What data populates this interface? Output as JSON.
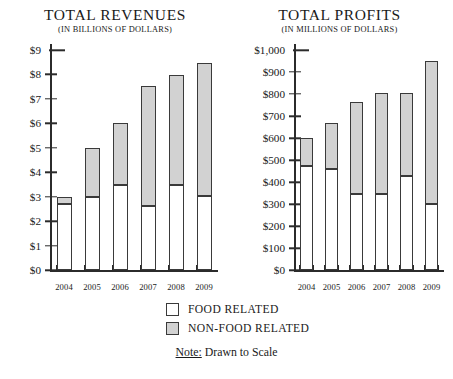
{
  "legend": {
    "items": [
      {
        "label": "FOOD RELATED",
        "key": "food",
        "color": "#ffffff"
      },
      {
        "label": "NON-FOOD RELATED",
        "key": "nonfood",
        "color": "#d2d2d2"
      }
    ],
    "note_key": "Note:",
    "note_text": "Drawn to Scale"
  },
  "chart_data": [
    {
      "type": "bar",
      "id": "total-revenues",
      "title": "TOTAL REVENUES",
      "subtitle": "(IN BILLIONS OF DOLLARS)",
      "stacked": true,
      "xlabel": "",
      "ylabel": "",
      "ylim": [
        0,
        9
      ],
      "ytick_step": 1,
      "ytick_labels": [
        "$0",
        "$1",
        "$2",
        "$3",
        "$4",
        "$5",
        "$6",
        "$7",
        "$8",
        "$9"
      ],
      "ytick_values": [
        0,
        1,
        2,
        3,
        4,
        5,
        6,
        7,
        8,
        9
      ],
      "grid": false,
      "legend_position": "below",
      "categories": [
        "2004",
        "2005",
        "2006",
        "2007",
        "2008",
        "2009"
      ],
      "series": [
        {
          "name": "FOOD RELATED",
          "color": "#ffffff",
          "values": [
            2.7,
            3.0,
            3.5,
            2.65,
            3.5,
            3.05
          ]
        },
        {
          "name": "NON-FOOD RELATED",
          "color": "#d2d2d2",
          "values": [
            0.3,
            2.0,
            2.5,
            4.9,
            4.5,
            5.4
          ]
        }
      ],
      "totals": [
        3.0,
        5.0,
        6.0,
        7.55,
        8.0,
        8.45
      ]
    },
    {
      "type": "bar",
      "id": "total-profits",
      "title": "TOTAL PROFITS",
      "subtitle": "(IN MILLIONS OF DOLLARS)",
      "stacked": true,
      "xlabel": "",
      "ylabel": "",
      "ylim": [
        0,
        1000
      ],
      "ytick_step": 100,
      "ytick_labels": [
        "$0",
        "$100",
        "$200",
        "$300",
        "$400",
        "$500",
        "$600",
        "$700",
        "$800",
        "$900",
        "$1,000"
      ],
      "ytick_values": [
        0,
        100,
        200,
        300,
        400,
        500,
        600,
        700,
        800,
        900,
        1000
      ],
      "grid": false,
      "legend_position": "below",
      "categories": [
        "2004",
        "2005",
        "2006",
        "2007",
        "2008",
        "2009"
      ],
      "series": [
        {
          "name": "FOOD RELATED",
          "color": "#ffffff",
          "values": [
            475,
            460,
            345,
            345,
            430,
            300
          ]
        },
        {
          "name": "NON-FOOD RELATED",
          "color": "#d2d2d2",
          "values": [
            125,
            210,
            420,
            460,
            375,
            650
          ]
        }
      ],
      "totals": [
        600,
        670,
        765,
        805,
        805,
        950
      ]
    }
  ]
}
